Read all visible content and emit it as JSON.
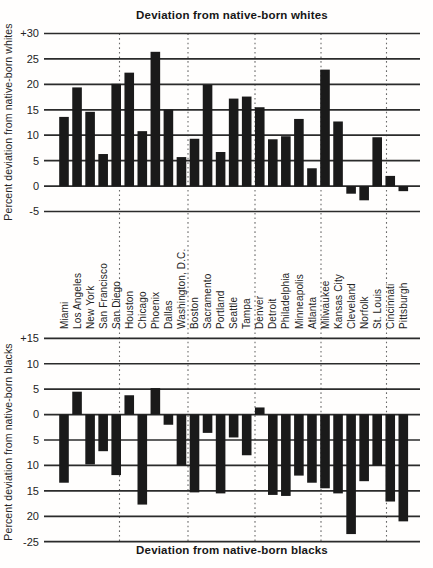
{
  "figure": {
    "background": "#fffefd",
    "ink_color": "#1a1a1a",
    "bar_color": "#1a1a1a",
    "gridline_color": "#2b2b2b",
    "separator_style": "vertical dotted lines between groups of five cities"
  },
  "chart_data": [
    {
      "type": "bar",
      "title": "Deviation from native-born whites",
      "title_position": "top",
      "ylabel": "Percent deviation from native-born whites",
      "xlabel": "",
      "ylim": [
        -5,
        30
      ],
      "ytick_values": [
        30,
        25,
        20,
        15,
        10,
        5,
        0,
        -5
      ],
      "ytick_labels": [
        "+30",
        "25",
        "20",
        "15",
        "10",
        "5",
        "0",
        "-5"
      ],
      "grid": "horizontal solid lines at every 5 units; dotted vertical group separators",
      "legend": "none",
      "categories": [
        "Miami",
        "Los Angeles",
        "New York",
        "San Francisco",
        "San Diego",
        "Houston",
        "Chicago",
        "Phoenix",
        "Dallas",
        "Washington, D.C.",
        "Boston",
        "Sacramento",
        "Portland",
        "Seattle",
        "Tampa",
        "Denver",
        "Detroit",
        "Philadelphia",
        "Minneapolis",
        "Atlanta",
        "Milwaukee",
        "Kansas City",
        "Cleveland",
        "Norfolk",
        "St. Louis",
        "Cincinnati",
        "Pittsburgh"
      ],
      "values": [
        13.6,
        19.4,
        14.6,
        6.3,
        20.1,
        22.3,
        10.8,
        26.4,
        15.0,
        5.7,
        9.3,
        19.9,
        6.7,
        17.2,
        17.6,
        15.5,
        9.2,
        9.8,
        13.2,
        3.5,
        22.9,
        12.7,
        -1.5,
        -2.8,
        9.6,
        2.0,
        -1.0
      ]
    },
    {
      "type": "bar",
      "title": "Deviation from native-born blacks",
      "title_position": "bottom",
      "ylabel": "Percent deviation from native-born blacks",
      "xlabel": "",
      "ylim": [
        -25,
        15
      ],
      "ytick_values": [
        15,
        10,
        5,
        0,
        -5,
        -10,
        -15,
        -20,
        -25
      ],
      "ytick_labels": [
        "+15",
        "10",
        "5",
        "0",
        "5",
        "10",
        "15",
        "20",
        "-25"
      ],
      "grid": "horizontal solid lines at every 5 units; dotted vertical group separators",
      "legend": "none",
      "categories": [
        "Miami",
        "Los Angeles",
        "New York",
        "San Francisco",
        "San Diego",
        "Houston",
        "Chicago",
        "Phoenix",
        "Dallas",
        "Washington, D.C.",
        "Boston",
        "Sacramento",
        "Portland",
        "Seattle",
        "Tampa",
        "Denver",
        "Detroit",
        "Philadelphia",
        "Minneapolis",
        "Atlanta",
        "Milwaukee",
        "Kansas City",
        "Cleveland",
        "Norfolk",
        "St. Louis",
        "Cincinnati",
        "Pittsburgh"
      ],
      "values": [
        -13.4,
        4.5,
        -9.8,
        -7.2,
        -11.9,
        3.8,
        -17.7,
        5.2,
        -2.0,
        -10.0,
        -15.3,
        -3.6,
        -15.5,
        -4.5,
        -8.0,
        1.4,
        -15.8,
        -16.0,
        -12.0,
        -13.4,
        -14.5,
        -15.5,
        -23.5,
        -13.1,
        -10.0,
        -17.1,
        -21.0
      ]
    }
  ],
  "city_groups_separated_after": [
    "San Diego",
    "Washington, D.C.",
    "Tampa",
    "Atlanta",
    "St. Louis"
  ]
}
